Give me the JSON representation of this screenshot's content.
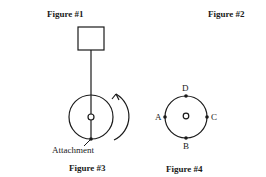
{
  "figures": {
    "fig1": {
      "caption": "Figure #1"
    },
    "fig2": {
      "caption": "Figure #2"
    },
    "fig3": {
      "caption": "Figure #3",
      "attachment_label": "Attachment",
      "rotation": "counterclockwise-arrow"
    },
    "fig4": {
      "caption": "Figure #4",
      "points": {
        "top": "D",
        "left": "A",
        "right": "C",
        "bottom": "B"
      }
    }
  },
  "colors": {
    "stroke": "#1a1a1a",
    "background": "#ffffff"
  }
}
